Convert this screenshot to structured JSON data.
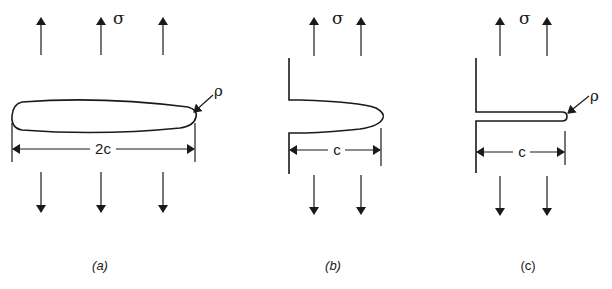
{
  "figure": {
    "panels": [
      {
        "id": "a",
        "caption": "(a)",
        "description": "Elliptical internal crack of length 2c under remote tensile stress",
        "stress_label": "σ",
        "dimension_label": "2c",
        "tip_radius_label": "ρ"
      },
      {
        "id": "b",
        "caption": "(b)",
        "description": "Edge notch of depth c under remote tensile stress",
        "stress_label": "σ",
        "dimension_label": "c"
      },
      {
        "id": "c",
        "caption": "(c)",
        "description": "Sharp edge crack of depth c with tip radius ρ under remote tensile stress",
        "stress_label": "σ",
        "dimension_label": "c",
        "tip_radius_label": "ρ"
      }
    ],
    "colors": {
      "ink": "#1a1a1a",
      "background": "#ffffff"
    }
  }
}
